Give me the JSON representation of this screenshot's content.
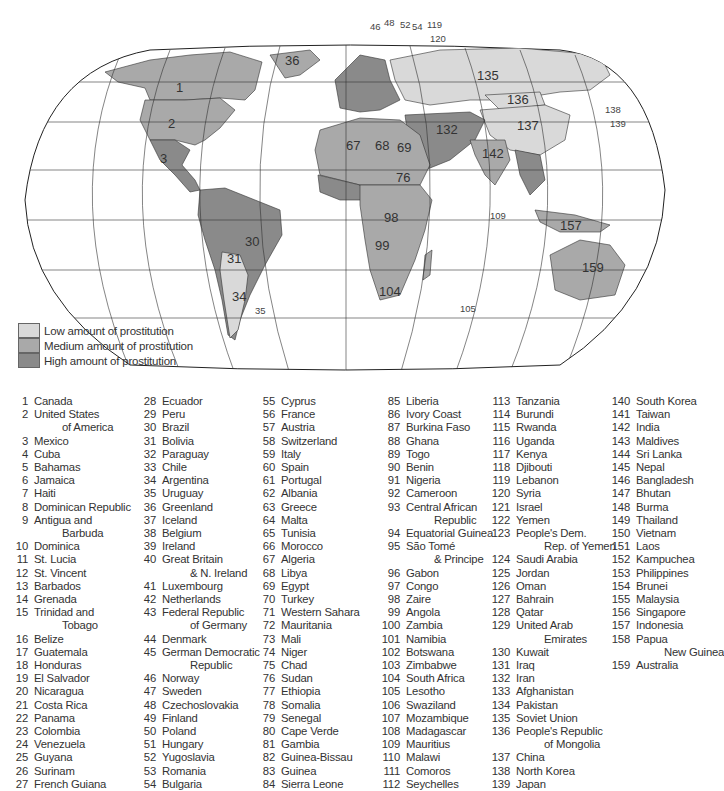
{
  "map": {
    "projection": "Eckert-style world map with graticule",
    "colors": {
      "low": "#d9d9d9",
      "medium": "#a9a9a9",
      "high": "#8a8a8a",
      "ocean": "#ffffff",
      "graticule": "#333333"
    },
    "legend": [
      {
        "level": "low",
        "label": "Low amount of prostitution",
        "color": "#d9d9d9"
      },
      {
        "level": "medium",
        "label": "Medium amount of prostitution",
        "color": "#a9a9a9"
      },
      {
        "level": "high",
        "label": "High amount of prostitution",
        "color": "#8a8a8a"
      }
    ],
    "region_labels": [
      {
        "n": "1",
        "x": 178,
        "y": 92
      },
      {
        "n": "2",
        "x": 170,
        "y": 126
      },
      {
        "n": "3",
        "x": 162,
        "y": 162
      },
      {
        "n": "30",
        "x": 250,
        "y": 245
      },
      {
        "n": "31",
        "x": 231,
        "y": 262
      },
      {
        "n": "34",
        "x": 238,
        "y": 301
      },
      {
        "n": "36",
        "x": 291,
        "y": 65
      },
      {
        "n": "135",
        "x": 483,
        "y": 80
      },
      {
        "n": "136",
        "x": 513,
        "y": 103
      },
      {
        "n": "137",
        "x": 523,
        "y": 128
      },
      {
        "n": "142",
        "x": 490,
        "y": 157
      },
      {
        "n": "159",
        "x": 590,
        "y": 271
      },
      {
        "n": "67",
        "x": 351,
        "y": 147
      },
      {
        "n": "68",
        "x": 380,
        "y": 147
      },
      {
        "n": "69",
        "x": 401,
        "y": 150
      },
      {
        "n": "76",
        "x": 402,
        "y": 181
      },
      {
        "n": "98",
        "x": 390,
        "y": 221
      },
      {
        "n": "99",
        "x": 381,
        "y": 249
      },
      {
        "n": "104",
        "x": 390,
        "y": 295
      },
      {
        "n": "132",
        "x": 441,
        "y": 132
      },
      {
        "n": "157",
        "x": 568,
        "y": 228
      }
    ]
  },
  "key": {
    "columns": [
      [
        {
          "n": "1",
          "name": "Canada"
        },
        {
          "n": "2",
          "name": "United States",
          "cont": "of America"
        },
        {
          "n": "3",
          "name": "Mexico"
        },
        {
          "n": "4",
          "name": "Cuba"
        },
        {
          "n": "5",
          "name": "Bahamas"
        },
        {
          "n": "6",
          "name": "Jamaica"
        },
        {
          "n": "7",
          "name": "Haiti"
        },
        {
          "n": "8",
          "name": "Dominican Republic"
        },
        {
          "n": "9",
          "name": "Antigua and",
          "cont": "Barbuda"
        },
        {
          "n": "10",
          "name": "Dominica"
        },
        {
          "n": "11",
          "name": "St. Lucia"
        },
        {
          "n": "12",
          "name": "St. Vincent"
        },
        {
          "n": "13",
          "name": "Barbados"
        },
        {
          "n": "14",
          "name": "Grenada"
        },
        {
          "n": "15",
          "name": "Trinidad and",
          "cont": "Tobago"
        },
        {
          "n": "16",
          "name": "Belize"
        },
        {
          "n": "17",
          "name": "Guatemala"
        },
        {
          "n": "18",
          "name": "Honduras"
        },
        {
          "n": "19",
          "name": "El Salvador"
        },
        {
          "n": "20",
          "name": "Nicaragua"
        },
        {
          "n": "21",
          "name": "Costa Rica"
        },
        {
          "n": "22",
          "name": "Panama"
        },
        {
          "n": "23",
          "name": "Colombia"
        },
        {
          "n": "24",
          "name": "Venezuela"
        },
        {
          "n": "25",
          "name": "Guyana"
        },
        {
          "n": "26",
          "name": "Surinam"
        },
        {
          "n": "27",
          "name": "French Guiana"
        }
      ],
      [
        {
          "n": "28",
          "name": "Ecuador"
        },
        {
          "n": "29",
          "name": "Peru"
        },
        {
          "n": "30",
          "name": "Brazil"
        },
        {
          "n": "31",
          "name": "Bolivia"
        },
        {
          "n": "32",
          "name": "Paraguay"
        },
        {
          "n": "33",
          "name": "Chile"
        },
        {
          "n": "34",
          "name": "Argentina"
        },
        {
          "n": "35",
          "name": "Uruguay"
        },
        {
          "n": "36",
          "name": "Greenland"
        },
        {
          "n": "37",
          "name": "Iceland"
        },
        {
          "n": "38",
          "name": "Belgium"
        },
        {
          "n": "39",
          "name": "Ireland"
        },
        {
          "n": "40",
          "name": "Great Britain",
          "cont": "& N. Ireland"
        },
        {
          "n": "41",
          "name": "Luxembourg"
        },
        {
          "n": "42",
          "name": "Netherlands"
        },
        {
          "n": "43",
          "name": "Federal Republic",
          "cont": "of Germany"
        },
        {
          "n": "44",
          "name": "Denmark"
        },
        {
          "n": "45",
          "name": "German Democratic",
          "cont": "Republic"
        },
        {
          "n": "46",
          "name": "Norway"
        },
        {
          "n": "47",
          "name": "Sweden"
        },
        {
          "n": "48",
          "name": "Czechoslovakia"
        },
        {
          "n": "49",
          "name": "Finland"
        },
        {
          "n": "50",
          "name": "Poland"
        },
        {
          "n": "51",
          "name": "Hungary"
        },
        {
          "n": "52",
          "name": "Yugoslavia"
        },
        {
          "n": "53",
          "name": "Romania"
        },
        {
          "n": "54",
          "name": "Bulgaria"
        }
      ],
      [
        {
          "n": "55",
          "name": "Cyprus"
        },
        {
          "n": "56",
          "name": "France"
        },
        {
          "n": "57",
          "name": "Austria"
        },
        {
          "n": "58",
          "name": "Switzerland"
        },
        {
          "n": "59",
          "name": "Italy"
        },
        {
          "n": "60",
          "name": "Spain"
        },
        {
          "n": "61",
          "name": "Portugal"
        },
        {
          "n": "62",
          "name": "Albania"
        },
        {
          "n": "63",
          "name": "Greece"
        },
        {
          "n": "64",
          "name": "Malta"
        },
        {
          "n": "65",
          "name": "Tunisia"
        },
        {
          "n": "66",
          "name": "Morocco"
        },
        {
          "n": "67",
          "name": "Algeria"
        },
        {
          "n": "68",
          "name": "Libya"
        },
        {
          "n": "69",
          "name": "Egypt"
        },
        {
          "n": "70",
          "name": "Turkey"
        },
        {
          "n": "71",
          "name": "Western Sahara"
        },
        {
          "n": "72",
          "name": "Mauritania"
        },
        {
          "n": "73",
          "name": "Mali"
        },
        {
          "n": "74",
          "name": "Niger"
        },
        {
          "n": "75",
          "name": "Chad"
        },
        {
          "n": "76",
          "name": "Sudan"
        },
        {
          "n": "77",
          "name": "Ethiopia"
        },
        {
          "n": "78",
          "name": "Somalia"
        },
        {
          "n": "79",
          "name": "Senegal"
        },
        {
          "n": "80",
          "name": "Cape Verde"
        },
        {
          "n": "81",
          "name": "Gambia"
        },
        {
          "n": "82",
          "name": "Guinea-Bissau"
        },
        {
          "n": "83",
          "name": "Guinea"
        },
        {
          "n": "84",
          "name": "Sierra Leone"
        }
      ],
      [
        {
          "n": "85",
          "name": "Liberia"
        },
        {
          "n": "86",
          "name": "Ivory Coast"
        },
        {
          "n": "87",
          "name": "Burkina Faso"
        },
        {
          "n": "88",
          "name": "Ghana"
        },
        {
          "n": "89",
          "name": "Togo"
        },
        {
          "n": "90",
          "name": "Benin"
        },
        {
          "n": "91",
          "name": "Nigeria"
        },
        {
          "n": "92",
          "name": "Cameroon"
        },
        {
          "n": "93",
          "name": "Central African",
          "cont": "Republic"
        },
        {
          "n": "94",
          "name": "Equatorial Guinea"
        },
        {
          "n": "95",
          "name": "São Tomé",
          "cont": "& Principe"
        },
        {
          "n": "96",
          "name": "Gabon"
        },
        {
          "n": "97",
          "name": "Congo"
        },
        {
          "n": "98",
          "name": "Zaire"
        },
        {
          "n": "99",
          "name": "Angola"
        },
        {
          "n": "100",
          "name": "Zambia"
        },
        {
          "n": "101",
          "name": "Namibia"
        },
        {
          "n": "102",
          "name": "Botswana"
        },
        {
          "n": "103",
          "name": "Zimbabwe"
        },
        {
          "n": "104",
          "name": "South Africa"
        },
        {
          "n": "105",
          "name": "Lesotho"
        },
        {
          "n": "106",
          "name": "Swaziland"
        },
        {
          "n": "107",
          "name": "Mozambique"
        },
        {
          "n": "108",
          "name": "Madagascar"
        },
        {
          "n": "109",
          "name": "Mauritius"
        },
        {
          "n": "110",
          "name": "Malawi"
        },
        {
          "n": "111",
          "name": "Comoros"
        },
        {
          "n": "112",
          "name": "Seychelles"
        }
      ],
      [
        {
          "n": "113",
          "name": "Tanzania"
        },
        {
          "n": "114",
          "name": "Burundi"
        },
        {
          "n": "115",
          "name": "Rwanda"
        },
        {
          "n": "116",
          "name": "Uganda"
        },
        {
          "n": "117",
          "name": "Kenya"
        },
        {
          "n": "118",
          "name": "Djibouti"
        },
        {
          "n": "119",
          "name": "Lebanon"
        },
        {
          "n": "120",
          "name": "Syria"
        },
        {
          "n": "121",
          "name": "Israel"
        },
        {
          "n": "122",
          "name": "Yemen"
        },
        {
          "n": "123",
          "name": "People's Dem.",
          "cont": "Rep. of Yemen"
        },
        {
          "n": "124",
          "name": "Saudi Arabia"
        },
        {
          "n": "125",
          "name": "Jordan"
        },
        {
          "n": "126",
          "name": "Oman"
        },
        {
          "n": "127",
          "name": "Bahrain"
        },
        {
          "n": "128",
          "name": "Qatar"
        },
        {
          "n": "129",
          "name": "United Arab",
          "cont": "Emirates"
        },
        {
          "n": "130",
          "name": "Kuwait"
        },
        {
          "n": "131",
          "name": "Iraq"
        },
        {
          "n": "132",
          "name": "Iran"
        },
        {
          "n": "133",
          "name": "Afghanistan"
        },
        {
          "n": "134",
          "name": "Pakistan"
        },
        {
          "n": "135",
          "name": "Soviet Union"
        },
        {
          "n": "136",
          "name": "People's Republic",
          "cont": "of Mongolia"
        },
        {
          "n": "137",
          "name": "China"
        },
        {
          "n": "138",
          "name": "North Korea"
        },
        {
          "n": "139",
          "name": "Japan"
        }
      ],
      [
        {
          "n": "140",
          "name": "South Korea"
        },
        {
          "n": "141",
          "name": "Taiwan"
        },
        {
          "n": "142",
          "name": "India"
        },
        {
          "n": "143",
          "name": "Maldives"
        },
        {
          "n": "144",
          "name": "Sri Lanka"
        },
        {
          "n": "145",
          "name": "Nepal"
        },
        {
          "n": "146",
          "name": "Bangladesh"
        },
        {
          "n": "147",
          "name": "Bhutan"
        },
        {
          "n": "148",
          "name": "Burma"
        },
        {
          "n": "149",
          "name": "Thailand"
        },
        {
          "n": "150",
          "name": "Vietnam"
        },
        {
          "n": "151",
          "name": "Laos"
        },
        {
          "n": "152",
          "name": "Kampuchea"
        },
        {
          "n": "153",
          "name": "Philippines"
        },
        {
          "n": "154",
          "name": "Brunei"
        },
        {
          "n": "155",
          "name": "Malaysia"
        },
        {
          "n": "156",
          "name": "Singapore"
        },
        {
          "n": "157",
          "name": "Indonesia"
        },
        {
          "n": "158",
          "name": "Papua",
          "cont": "New Guinea"
        },
        {
          "n": "159",
          "name": "Australia"
        }
      ]
    ]
  }
}
